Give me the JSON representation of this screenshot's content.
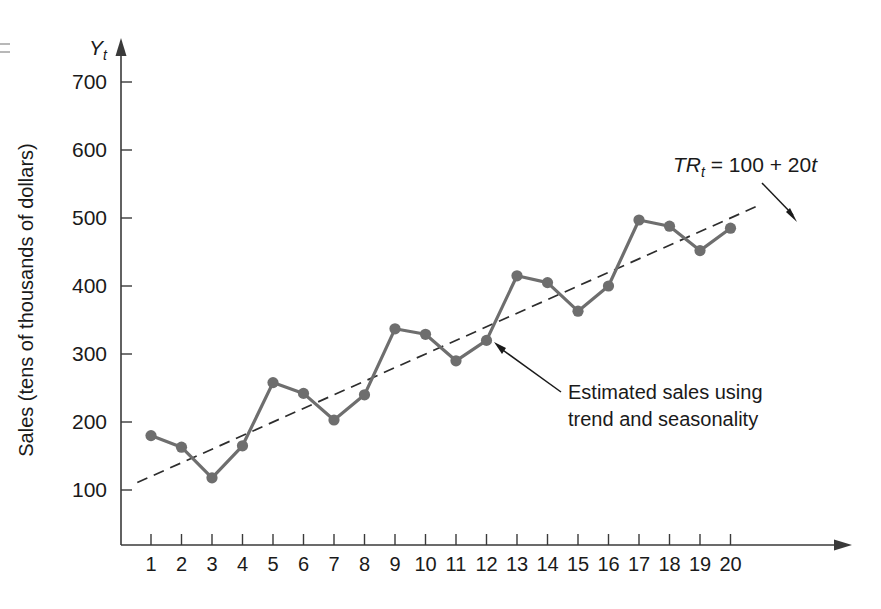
{
  "figure": {
    "y_axis": {
      "symbol": "Y",
      "symbol_subscript": "t",
      "title": "Sales (tens of thousands of dollars)",
      "ticks": [
        100,
        200,
        300,
        400,
        500,
        600,
        700
      ],
      "min": 0,
      "max": 760
    },
    "x_axis": {
      "ticks": [
        1,
        2,
        3,
        4,
        5,
        6,
        7,
        8,
        9,
        10,
        11,
        12,
        13,
        14,
        15,
        16,
        17,
        18,
        19,
        20
      ],
      "min": 0.35,
      "max": 21.4
    },
    "equation": {
      "lhs": "TR",
      "lhs_subscript": "t",
      "rhs": " = 100 + 20",
      "rhs_var": "t",
      "full": "TRt = 100 + 20t",
      "intercept": 100,
      "slope": 20
    },
    "annotation": {
      "line1": "Estimated sales using",
      "line2": "trend and seasonality"
    },
    "colors": {
      "series": "#6e6e6e",
      "trend": "#2d2d2d",
      "axis": "#3a3a3a",
      "text": "#1a1a1a",
      "background": "#ffffff"
    }
  },
  "chart_data": {
    "type": "line",
    "title": "",
    "xlabel": "",
    "ylabel": "Sales (tens of thousands of dollars)",
    "xlim": [
      0.35,
      21.4
    ],
    "ylim": [
      0,
      760
    ],
    "grid": false,
    "legend": "none",
    "x": [
      1,
      2,
      3,
      4,
      5,
      6,
      7,
      8,
      9,
      10,
      11,
      12,
      13,
      14,
      15,
      16,
      17,
      18,
      19,
      20
    ],
    "series": [
      {
        "name": "Estimated sales using trend and seasonality",
        "style": "solid-with-markers",
        "color": "#6e6e6e",
        "values": [
          180,
          163,
          118,
          165,
          258,
          242,
          203,
          240,
          337,
          329,
          290,
          320,
          415,
          405,
          363,
          400,
          497,
          488,
          452,
          485
        ]
      },
      {
        "name": "TRt = 100 + 20t",
        "style": "dashed",
        "color": "#2d2d2d",
        "values": [
          120,
          140,
          160,
          180,
          200,
          220,
          240,
          260,
          280,
          300,
          320,
          340,
          360,
          380,
          400,
          420,
          440,
          460,
          480,
          500
        ]
      }
    ],
    "annotations": [
      {
        "text": "TRt = 100 + 20t",
        "target_series": "TRt = 100 + 20t",
        "target_x": 19.2
      },
      {
        "text": "Estimated sales using trend and seasonality",
        "target_series": "Estimated sales using trend and seasonality",
        "target_x": 12
      }
    ]
  }
}
